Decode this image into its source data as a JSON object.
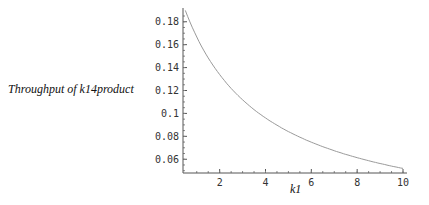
{
  "chart_data": {
    "type": "line",
    "title": "",
    "xlabel": "k1",
    "ylabel": "Throughput of k14product",
    "xlim": [
      0.4,
      10
    ],
    "ylim": [
      0.048,
      0.192
    ],
    "x_ticks": [
      2,
      4,
      6,
      8,
      10
    ],
    "y_ticks": [
      0.06,
      0.08,
      0.1,
      0.12,
      0.14,
      0.16,
      0.18
    ],
    "y_tick_labels": [
      "0.06",
      "0.08",
      "0.1",
      "0.12",
      "0.14",
      "0.16",
      "0.18"
    ],
    "grid": false,
    "legend": null,
    "series": [
      {
        "name": "Throughput of k14product",
        "color": "#9a9a9a",
        "x": [
          0.6,
          1,
          1.5,
          2,
          2.5,
          3,
          3.5,
          4,
          4.5,
          5,
          5.5,
          6,
          6.5,
          7,
          7.5,
          8,
          8.5,
          9,
          9.5,
          10
        ],
        "values": [
          0.185,
          0.167,
          0.148,
          0.134,
          0.122,
          0.112,
          0.103,
          0.096,
          0.09,
          0.084,
          0.079,
          0.075,
          0.071,
          0.067,
          0.064,
          0.061,
          0.058,
          0.056,
          0.053,
          0.051
        ]
      }
    ]
  },
  "colors": {
    "axis": "#555555",
    "curve": "#9a9a9a",
    "text": "#333333"
  }
}
